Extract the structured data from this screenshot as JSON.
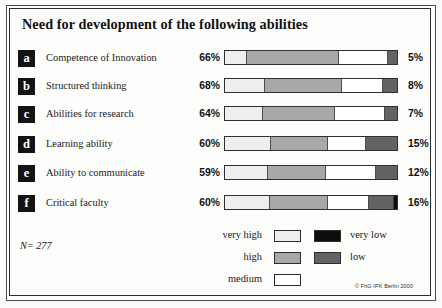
{
  "title": "Need for development of the following abilities",
  "sample_note": "N= 277",
  "copyright": "© FhG IPK Berlin 2000",
  "legend": {
    "rows": [
      {
        "left_label": "very high",
        "left_swatch": "vhigh",
        "right_swatch": "vlow",
        "right_label": "very low"
      },
      {
        "left_label": "high",
        "left_swatch": "high",
        "right_swatch": "low",
        "right_label": "low"
      },
      {
        "left_label": "medium",
        "left_swatch": "medium",
        "right_swatch": "",
        "right_label": ""
      }
    ]
  },
  "colors": {
    "very_high": "#eeeeee",
    "high": "#a8a8a8",
    "medium": "#ffffff",
    "low": "#636363",
    "very_low": "#0d0d0d",
    "tag_background": "#131313",
    "frame": "#2b2b2b"
  },
  "chart_data": {
    "type": "bar",
    "subtype": "stacked-horizontal-diverging",
    "title": "Need for development of the following abilities",
    "xlabel": "",
    "ylabel": "",
    "xlim": [
      0,
      100
    ],
    "grid": false,
    "legend_position": "bottom",
    "annotations": [
      "N= 277",
      "© FhG IPK Berlin 2000"
    ],
    "series": [
      {
        "name": "very high",
        "color": "#eeeeee",
        "values": [
          13,
          23,
          22,
          27,
          25,
          26
        ]
      },
      {
        "name": "high",
        "color": "#a8a8a8",
        "values": [
          53,
          45,
          42,
          33,
          34,
          34
        ]
      },
      {
        "name": "medium",
        "color": "#ffffff",
        "values": [
          29,
          24,
          29,
          22,
          29,
          24
        ]
      },
      {
        "name": "low",
        "color": "#636363",
        "values": [
          5,
          8,
          7,
          15,
          12,
          14
        ]
      },
      {
        "name": "very low",
        "color": "#0d0d0d",
        "values": [
          0,
          0,
          0,
          0,
          0,
          2
        ]
      }
    ],
    "categories": [
      "Competence of Innovation",
      "Structured thinking",
      "Abilities for research",
      "Learning ability",
      "Ability to communicate",
      "Critical faculty"
    ],
    "left_totals": [
      "66%",
      "68%",
      "64%",
      "60%",
      "59%",
      "60%"
    ],
    "right_totals": [
      "5%",
      "8%",
      "7%",
      "15%",
      "12%",
      "16%"
    ]
  },
  "rows": [
    {
      "tag": "a",
      "label": "Competence of Innovation",
      "left_pct": "66%",
      "right_pct": "5%",
      "segments": [
        {
          "cls": "vhigh",
          "w": 13
        },
        {
          "cls": "high",
          "w": 53
        },
        {
          "cls": "medium",
          "w": 29
        },
        {
          "cls": "low",
          "w": 5
        }
      ]
    },
    {
      "tag": "b",
      "label": "Structured thinking",
      "left_pct": "68%",
      "right_pct": "8%",
      "segments": [
        {
          "cls": "vhigh",
          "w": 23
        },
        {
          "cls": "high",
          "w": 45
        },
        {
          "cls": "medium",
          "w": 24
        },
        {
          "cls": "low",
          "w": 8
        }
      ]
    },
    {
      "tag": "c",
      "label": "Abilities for research",
      "left_pct": "64%",
      "right_pct": "7%",
      "segments": [
        {
          "cls": "vhigh",
          "w": 22
        },
        {
          "cls": "high",
          "w": 42
        },
        {
          "cls": "medium",
          "w": 29
        },
        {
          "cls": "low",
          "w": 7
        }
      ]
    },
    {
      "tag": "d",
      "label": "Learning ability",
      "left_pct": "60%",
      "right_pct": "15%",
      "segments": [
        {
          "cls": "vhigh",
          "w": 27
        },
        {
          "cls": "high",
          "w": 33
        },
        {
          "cls": "medium",
          "w": 22
        },
        {
          "cls": "low",
          "w": 18
        }
      ]
    },
    {
      "tag": "e",
      "label": "Ability to communicate",
      "left_pct": "59%",
      "right_pct": "12%",
      "segments": [
        {
          "cls": "vhigh",
          "w": 25
        },
        {
          "cls": "high",
          "w": 34
        },
        {
          "cls": "medium",
          "w": 29
        },
        {
          "cls": "low",
          "w": 12
        }
      ]
    },
    {
      "tag": "f",
      "label": "Critical faculty",
      "left_pct": "60%",
      "right_pct": "16%",
      "segments": [
        {
          "cls": "vhigh",
          "w": 26
        },
        {
          "cls": "high",
          "w": 34
        },
        {
          "cls": "medium",
          "w": 24
        },
        {
          "cls": "low",
          "w": 14
        },
        {
          "cls": "vlow",
          "w": 2
        }
      ]
    }
  ]
}
